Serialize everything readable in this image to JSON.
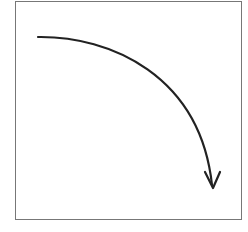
{
  "diagram": {
    "type": "curved-arrow",
    "frame_color": "#777777",
    "stroke_color": "#222222",
    "arrow": {
      "start": [
        38,
        37
      ],
      "end": [
        213,
        186
      ],
      "direction": "down"
    }
  }
}
